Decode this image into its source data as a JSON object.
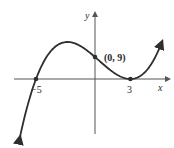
{
  "chart_data": {
    "type": "line",
    "title": "",
    "xlabel": "x",
    "ylabel": "y",
    "function": "f(x) = (1/5)(x + 5)(x - 3)^2",
    "series": [
      {
        "name": "polynomial curve",
        "x": [
          -6.3,
          -5,
          -4,
          -3,
          -2,
          -1,
          0,
          1,
          2,
          3,
          4,
          5,
          5.6
        ],
        "values": [
          -12.5,
          0,
          9.8,
          14.4,
          15,
          12.8,
          9,
          4.8,
          1.4,
          0,
          1.8,
          8,
          14.1
        ]
      }
    ],
    "labeled_points": [
      {
        "x": -5,
        "y": 0,
        "label": "−5"
      },
      {
        "x": 0,
        "y": 9,
        "label": "(0, 9)"
      },
      {
        "x": 3,
        "y": 0,
        "label": "3"
      }
    ],
    "x_ticks": [
      "−5",
      "3"
    ],
    "grid": false,
    "legend": null
  },
  "labels": {
    "x_axis": "x",
    "y_axis": "y",
    "neg_five": "−5",
    "three": "3",
    "intercept": "(0, 9)"
  },
  "colors": {
    "curve": "#2e2e2e",
    "axes": "#555555",
    "background": "#ffffff"
  }
}
